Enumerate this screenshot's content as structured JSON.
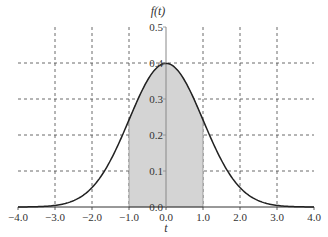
{
  "chart_data": {
    "type": "area",
    "title": "",
    "function": "standard normal pdf f(t) = exp(-t^2/2)/sqrt(2*pi)",
    "xlabel": "t",
    "ylabel": "f(t)",
    "xlim": [
      -4.0,
      4.0
    ],
    "ylim": [
      0.0,
      0.5
    ],
    "x_ticks": [
      "-4.0",
      "-3.0",
      "-2.0",
      "-1.0",
      "0.0",
      "1.0",
      "2.0",
      "3.0",
      "4.0"
    ],
    "y_ticks": [
      "0.0",
      "0.1",
      "0.2",
      "0.3",
      "0.4",
      "0.5"
    ],
    "grid": true,
    "grid_style": "dashed",
    "shaded_region": {
      "from": -1.0,
      "to": 1.0,
      "color": "#d4d4d4"
    },
    "x": [
      -4.0,
      -3.5,
      -3.0,
      -2.5,
      -2.0,
      -1.5,
      -1.0,
      -0.5,
      0.0,
      0.5,
      1.0,
      1.5,
      2.0,
      2.5,
      3.0,
      3.5,
      4.0
    ],
    "values": [
      0.0001,
      0.0009,
      0.0044,
      0.0175,
      0.054,
      0.1295,
      0.242,
      0.3521,
      0.3989,
      0.3521,
      0.242,
      0.1295,
      0.054,
      0.0175,
      0.0044,
      0.0009,
      0.0001
    ],
    "colors": {
      "curve": "#222222",
      "shade": "#d4d4d4",
      "shade_edge": "#888888",
      "grid": "#444444",
      "axis": "#888888"
    }
  }
}
